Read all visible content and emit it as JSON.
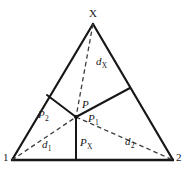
{
  "figure": {
    "type": "geometry-diagram",
    "background_color": "#ffffff",
    "line_color": "#171717",
    "dash_color": "#3c3c3c"
  },
  "geometry": {
    "vertices": {
      "apex": {
        "x": 93,
        "y": 24,
        "label": "X"
      },
      "bottom_left": {
        "x": 12,
        "y": 160,
        "label": "1"
      },
      "bottom_right": {
        "x": 173,
        "y": 160,
        "label": "2"
      }
    },
    "interior_point": {
      "x": 76,
      "y": 117,
      "label": "P"
    },
    "edge_point_left": {
      "x": 47,
      "y": 95
    },
    "edge_point_right": {
      "x": 130,
      "y": 88
    },
    "foot_point": {
      "x": 76,
      "y": 160
    },
    "solid_segments": [
      {
        "name": "triangle-left-edge",
        "from": [
          93,
          24
        ],
        "to": [
          12,
          160
        ]
      },
      {
        "name": "triangle-right-edge",
        "from": [
          93,
          24
        ],
        "to": [
          173,
          160
        ]
      },
      {
        "name": "triangle-base",
        "from": [
          12,
          160
        ],
        "to": [
          173,
          160
        ]
      },
      {
        "name": "segment-p2",
        "from": [
          76,
          117
        ],
        "to": [
          47,
          95
        ]
      },
      {
        "name": "segment-p1",
        "from": [
          76,
          117
        ],
        "to": [
          130,
          88
        ]
      },
      {
        "name": "segment-px",
        "from": [
          76,
          117
        ],
        "to": [
          76,
          160
        ]
      }
    ],
    "dashed_segments": [
      {
        "name": "distance-dx",
        "from": [
          93,
          24
        ],
        "to": [
          76,
          117
        ]
      },
      {
        "name": "distance-d1",
        "from": [
          12,
          160
        ],
        "to": [
          76,
          117
        ]
      },
      {
        "name": "distance-d2",
        "from": [
          76,
          117
        ],
        "to": [
          173,
          160
        ]
      }
    ]
  },
  "labels": {
    "apex_x": {
      "text": "X",
      "x": 89,
      "y": 8,
      "style": "plain"
    },
    "corner_1": {
      "text": "1",
      "x": 3,
      "y": 152,
      "style": "plain"
    },
    "corner_2": {
      "text": "2",
      "x": 176,
      "y": 152,
      "style": "plain"
    },
    "dist_x": {
      "base": "d",
      "sub": "X",
      "x": 96,
      "y": 56,
      "style": "italic"
    },
    "dist_1": {
      "base": "d",
      "sub": "1",
      "x": 42,
      "y": 139,
      "style": "italic"
    },
    "dist_2": {
      "base": "d",
      "sub": "2",
      "x": 125,
      "y": 136,
      "style": "italic"
    },
    "point_p": {
      "base": "P",
      "sub": "",
      "x": 82,
      "y": 99,
      "style": "italic"
    },
    "point_p1": {
      "base": "P",
      "sub": "1",
      "x": 88,
      "y": 113,
      "style": "italic"
    },
    "point_p2": {
      "base": "P",
      "sub": "2",
      "x": 38,
      "y": 109,
      "style": "italic"
    },
    "point_px": {
      "base": "P",
      "sub": "X",
      "x": 80,
      "y": 137,
      "style": "italic"
    }
  }
}
